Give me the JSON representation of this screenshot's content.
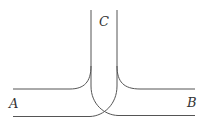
{
  "diagram": {
    "stroke_color": "#555555",
    "labels": {
      "c": "C",
      "a": "A",
      "b": "B"
    },
    "nodes": [
      {
        "id": "C",
        "position": "top-center",
        "x": 104,
        "y": 25
      },
      {
        "id": "A",
        "position": "left",
        "x": 14,
        "y": 104
      },
      {
        "id": "B",
        "position": "right",
        "x": 193,
        "y": 104
      }
    ],
    "paths": [
      {
        "name": "upper-left-wall",
        "from": "A-top",
        "to": "C-left"
      },
      {
        "name": "upper-right-wall",
        "from": "C-right",
        "to": "B-top"
      },
      {
        "name": "crossing-wall-left-to-bottom-right",
        "from": "C-left",
        "to": "B-bottom"
      },
      {
        "name": "crossing-wall-right-to-bottom-left",
        "from": "C-right",
        "to": "A-bottom"
      }
    ]
  }
}
